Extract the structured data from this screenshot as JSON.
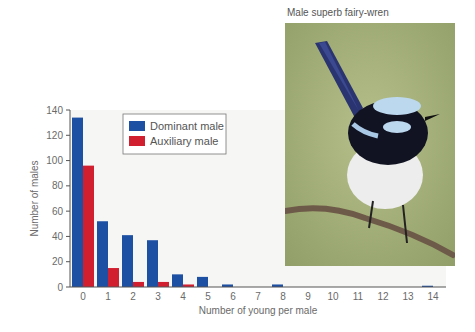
{
  "photo": {
    "caption": "Male superb fairy-wren",
    "subject": "bird-photo",
    "colors": {
      "background": "#a9b57e",
      "tail": "#2a3470",
      "cap": "#bcd8ef",
      "mask": "#111322",
      "belly": "#eeeeee",
      "branch": "#6e5a48"
    }
  },
  "colors": {
    "dominant": "#1d4fa3",
    "auxiliary": "#d21f30",
    "plot_bg": "#f6f6f4",
    "axis": "#555555"
  },
  "chart_data": {
    "type": "bar",
    "title": "",
    "xlabel": "Number of young per male",
    "ylabel": "Number of males",
    "ylim": [
      0,
      140
    ],
    "yticks": [
      0,
      20,
      40,
      60,
      80,
      100,
      120,
      140
    ],
    "categories": [
      "0",
      "1",
      "2",
      "3",
      "4",
      "5",
      "6",
      "7",
      "8",
      "9",
      "10",
      "11",
      "12",
      "13",
      "14"
    ],
    "series": [
      {
        "name": "Dominant male",
        "values": [
          134,
          52,
          41,
          37,
          10,
          8,
          2,
          0,
          2,
          0,
          0,
          0,
          0,
          0,
          1
        ]
      },
      {
        "name": "Auxiliary male",
        "values": [
          96,
          15,
          4,
          4,
          2,
          0,
          0,
          0,
          0,
          0,
          0,
          0,
          0,
          0,
          0
        ]
      }
    ],
    "legend": {
      "position": "top-left-inside",
      "entries": [
        "Dominant male",
        "Auxiliary male"
      ]
    },
    "grid": false
  }
}
